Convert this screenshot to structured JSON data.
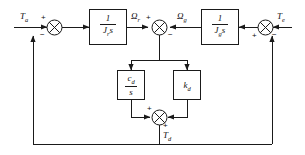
{
  "diagram": {
    "type": "control-block-diagram",
    "stroke_color": "#1a1a1a",
    "background_color": "#ffffff",
    "signals": {
      "input_left": "T",
      "input_left_sub": "a",
      "input_right": "T",
      "input_right_sub": "e",
      "omega_rotor": "Ω",
      "omega_rotor_sub": "r",
      "omega_generator": "Ω",
      "omega_generator_sub": "g",
      "torsion_torque": "T",
      "torsion_torque_sub": "d"
    },
    "blocks": [
      {
        "name": "rotor-inertia-block",
        "numerator": "1",
        "denominator": "J",
        "denominator_sub": "r",
        "denominator_tail": "s",
        "expression": "1/(J_r s)"
      },
      {
        "name": "generator-inertia-block",
        "numerator": "1",
        "denominator": "J",
        "denominator_sub": "g",
        "denominator_tail": "s",
        "expression": "1/(J_g s)"
      },
      {
        "name": "damping-integrator-block",
        "numerator": "c",
        "numerator_sub": "d",
        "denominator": "s",
        "expression": "c_d/s"
      },
      {
        "name": "stiffness-gain-block",
        "gain": "k",
        "gain_sub": "d",
        "expression": "k_d"
      }
    ],
    "summing_junctions": [
      {
        "name": "left-summing-junction",
        "signs": {
          "top": "+",
          "bottom": "−"
        }
      },
      {
        "name": "center-summing-junction",
        "signs": {
          "left": "+",
          "right": "−"
        }
      },
      {
        "name": "right-summing-junction",
        "signs": {
          "right": "−",
          "bottom": "+"
        }
      },
      {
        "name": "bottom-summing-junction",
        "signs": {
          "left": "+",
          "bottom": "+"
        }
      }
    ]
  }
}
